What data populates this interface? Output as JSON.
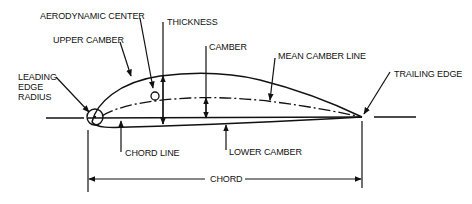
{
  "diagram": {
    "labels": {
      "aerodynamic_center": "AERODYNAMIC CENTER",
      "thickness": "THICKNESS",
      "upper_camber": "UPPER CAMBER",
      "camber": "CAMBER",
      "mean_camber_line": "MEAN CAMBER LINE",
      "leading_edge_radius_1": "LEADING",
      "leading_edge_radius_2": "EDGE",
      "leading_edge_radius_3": "RADIUS",
      "trailing_edge": "TRAILING EDGE",
      "chord_line": "CHORD LINE",
      "lower_camber": "LOWER CAMBER",
      "chord": "CHORD"
    },
    "colors": {
      "stroke": "#111111",
      "background": "#ffffff"
    }
  }
}
